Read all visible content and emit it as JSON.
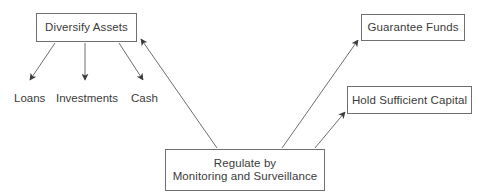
{
  "diagram": {
    "background_color": "#ffffff",
    "line_color": "#6f6f6f",
    "text_color": "#3b3b3b",
    "box_border_color": "#6f6f6f",
    "nodes": {
      "diversify_assets": {
        "label": "Diversify Assets",
        "shape": "rectangle",
        "x": 36,
        "y": 13,
        "w": 101,
        "h": 29
      },
      "guarantee_funds": {
        "label": "Guarantee Funds",
        "shape": "rectangle",
        "x": 361,
        "y": 14,
        "w": 104,
        "h": 27
      },
      "hold_sufficient_capital": {
        "label": "Hold Sufficient Capital",
        "shape": "rectangle",
        "x": 347,
        "y": 86,
        "w": 125,
        "h": 28
      },
      "regulate": {
        "label": "Regulate by\nMonitoring and Surveillance",
        "shape": "rectangle",
        "x": 165,
        "y": 149,
        "w": 160,
        "h": 42
      }
    },
    "leaf_labels": [
      {
        "id": "loans",
        "label": "Loans",
        "x": 14,
        "y": 92
      },
      {
        "id": "investments",
        "label": "Investments",
        "x": 56,
        "y": 92
      },
      {
        "id": "cash",
        "label": "Cash",
        "x": 131,
        "y": 92
      }
    ],
    "edges": [
      {
        "id": "diversify-to-loans",
        "from": "Diversify Assets",
        "to": "Loans",
        "arrow": "to"
      },
      {
        "id": "diversify-to-investments",
        "from": "Diversify Assets",
        "to": "Investments",
        "arrow": "to"
      },
      {
        "id": "diversify-to-cash",
        "from": "Diversify Assets",
        "to": "Cash",
        "arrow": "to"
      },
      {
        "id": "regulate-to-diversify",
        "from": "Regulate by Monitoring and Surveillance",
        "to": "Diversify Assets",
        "arrow": "to"
      },
      {
        "id": "regulate-to-guarantee",
        "from": "Regulate by Monitoring and Surveillance",
        "to": "Guarantee Funds",
        "arrow": "to"
      },
      {
        "id": "regulate-to-capital",
        "from": "Regulate by Monitoring and Surveillance",
        "to": "Hold Sufficient Capital",
        "arrow": "to"
      }
    ]
  }
}
